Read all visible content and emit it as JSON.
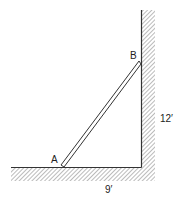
{
  "diagram": {
    "labels": {
      "point_a": "A",
      "point_b": "B",
      "height": "12′",
      "base": "9′"
    },
    "colors": {
      "line": "#333333",
      "hatch": "#777777",
      "background": "#ffffff"
    }
  }
}
